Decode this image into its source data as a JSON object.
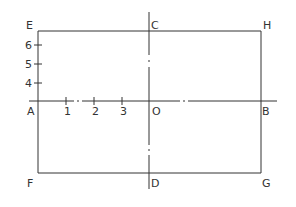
{
  "diagram": {
    "type": "geometric-construction",
    "colors": {
      "line": "#333333",
      "background": "#ffffff"
    },
    "points": {
      "E": "E",
      "C": "C",
      "H": "H",
      "A": "A",
      "O": "O",
      "B": "B",
      "F": "F",
      "D": "D",
      "G": "G"
    },
    "horizontal_ticks": [
      "1",
      "2",
      "3"
    ],
    "vertical_ticks": [
      "6",
      "5",
      "4"
    ],
    "lines": {
      "rectangle": "EHGF",
      "horizontal_axis": "AB (dash-dot between 1-2 and O-B)",
      "vertical_axis": "CD (dash-dot centerline)"
    }
  }
}
